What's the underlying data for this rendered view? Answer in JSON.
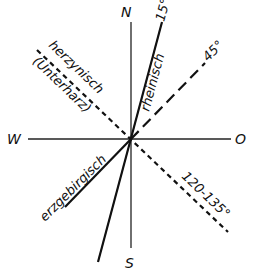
{
  "diagram": {
    "type": "strike-direction rose",
    "cardinals": {
      "north": "N",
      "south": "S",
      "west": "W",
      "east": "O"
    },
    "directions": [
      {
        "name": "rheinisch",
        "angle_label": "15°",
        "style": "solid-thick"
      },
      {
        "name": "",
        "angle_label": "45°",
        "style": "long-dash"
      },
      {
        "name": "herzynisch",
        "sub_name": "(Unterharz)",
        "angle_label": "120-135°",
        "style": "short-dash"
      },
      {
        "name": "erzgebirgisch",
        "angle_label": "",
        "style": "solid-thick"
      }
    ],
    "colors": {
      "line": "#111111",
      "background": "#ffffff"
    }
  }
}
